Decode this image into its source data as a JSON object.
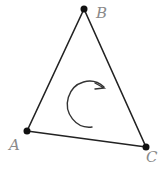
{
  "diagram": {
    "type": "triangle-orientation",
    "vertices": [
      {
        "label": "A",
        "x": 27,
        "y": 131
      },
      {
        "label": "B",
        "x": 84,
        "y": 9
      },
      {
        "label": "C",
        "x": 146,
        "y": 147
      }
    ],
    "rotation": {
      "direction": "clockwise",
      "icon": "clockwise-arrow-icon"
    },
    "colors": {
      "stroke": "#222222",
      "label": "#8a8a8a"
    }
  },
  "labels": {
    "a": "A",
    "b": "B",
    "c": "C"
  }
}
